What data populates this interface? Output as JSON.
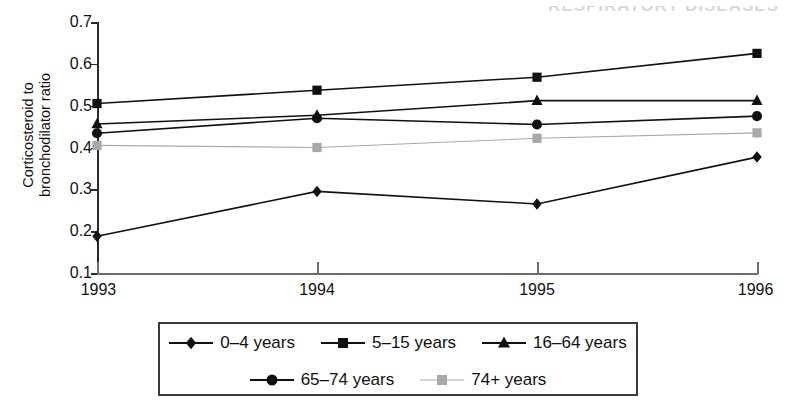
{
  "artifacts": {
    "cut_off_header_text": "RESPIRATORY DISEASES"
  },
  "axes": {
    "y_label": "Corticosteroid to\nbronchodilator ratio",
    "y_ticks": [
      "0.7",
      "0.6",
      "0.5",
      "0.4",
      "0.3",
      "0.2",
      "0.1"
    ],
    "x_ticks": [
      "1993",
      "1994",
      "1995",
      "1996"
    ]
  },
  "legend": {
    "row1": [
      {
        "label": "0–4 years",
        "marker": "diamond",
        "color": "#111111"
      },
      {
        "label": "5–15 years",
        "marker": "square",
        "color": "#111111"
      },
      {
        "label": "16–64 years",
        "marker": "triangle",
        "color": "#111111"
      }
    ],
    "row2": [
      {
        "label": "65–74 years",
        "marker": "circle",
        "color": "#111111"
      },
      {
        "label": "74+ years",
        "marker": "square",
        "color": "#a8a8a8"
      }
    ]
  },
  "chart_data": {
    "type": "line",
    "title": "",
    "xlabel": "",
    "ylabel": "Corticosteroid to bronchodilator ratio",
    "x": [
      "1993",
      "1994",
      "1995",
      "1996"
    ],
    "ylim": [
      0.1,
      0.7
    ],
    "ytick_step": 0.1,
    "grid": false,
    "legend_position": "bottom",
    "series": [
      {
        "name": "0–4 years",
        "marker": "diamond",
        "color": "#111111",
        "values": [
          0.188,
          0.295,
          0.265,
          0.377
        ]
      },
      {
        "name": "5–15 years",
        "marker": "square",
        "color": "#111111",
        "values": [
          0.505,
          0.537,
          0.568,
          0.625
        ]
      },
      {
        "name": "16–64 years",
        "marker": "triangle",
        "color": "#111111",
        "values": [
          0.456,
          0.477,
          0.512,
          0.512
        ]
      },
      {
        "name": "65–74 years",
        "marker": "circle",
        "color": "#111111",
        "values": [
          0.434,
          0.47,
          0.455,
          0.475
        ]
      },
      {
        "name": "74+ years",
        "marker": "square",
        "color": "#a8a8a8",
        "values": [
          0.405,
          0.4,
          0.422,
          0.435
        ]
      }
    ]
  }
}
